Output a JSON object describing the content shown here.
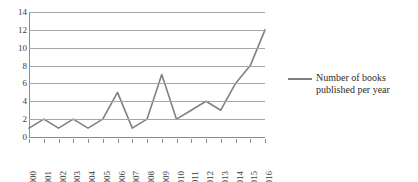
{
  "chart_data": {
    "type": "line",
    "title": "",
    "xlabel": "",
    "ylabel": "",
    "categories": [
      "2000",
      "2001",
      "2002",
      "2003",
      "2004",
      "2005",
      "2006",
      "2007",
      "2008",
      "2009",
      "2010",
      "2011",
      "2012",
      "2013",
      "2014",
      "2015",
      "2016"
    ],
    "values": [
      1,
      2,
      1,
      2,
      1,
      2,
      5,
      1,
      2,
      7,
      2,
      3,
      4,
      3,
      6,
      8,
      12
    ],
    "series": [
      {
        "name": "Number of books published per year",
        "values": [
          1,
          2,
          1,
          2,
          1,
          2,
          5,
          1,
          2,
          7,
          2,
          3,
          4,
          3,
          6,
          8,
          12
        ],
        "color": "#808080"
      }
    ],
    "ylim": [
      0,
      14
    ],
    "yticks": [
      0,
      2,
      4,
      6,
      8,
      10,
      12,
      14
    ],
    "ytick_labels": [
      "0",
      "2",
      "4",
      "6",
      "8",
      "10",
      "12",
      "14"
    ],
    "grid": true,
    "grid_axis": "y",
    "legend_position": "right",
    "xtick_rotation": 90
  },
  "legend": {
    "entries": [
      {
        "label": "Number of books published per year",
        "color": "#808080"
      }
    ]
  },
  "colors": {
    "series_line": "#808080",
    "grid": "#a6a6a6",
    "axis": "#8c8c8c",
    "text": "#3b3b3b",
    "background": "#ffffff"
  }
}
